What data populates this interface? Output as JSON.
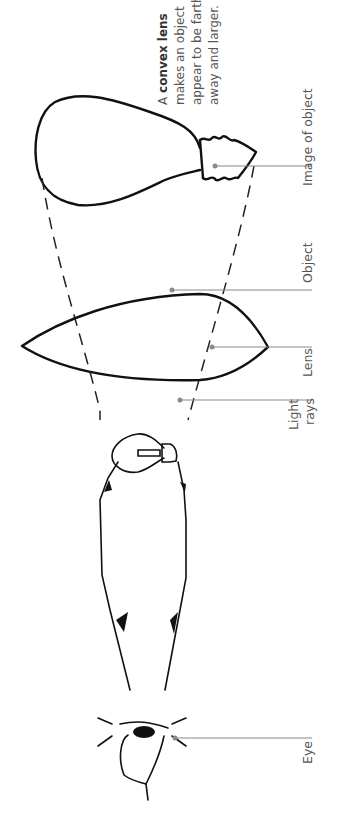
{
  "diagram": {
    "caption": {
      "line1_prefix": "A ",
      "line1_bold": "convex lens",
      "line2": "makes an object",
      "line3": "appear to be farther",
      "line4": "away and larger."
    },
    "labels": {
      "image_of_object": "Image of object",
      "object": "Object",
      "lens": "Lens",
      "light_rays_line1": "Light",
      "light_rays_line2": "rays",
      "eye": "Eye"
    },
    "colors": {
      "ink": "#111111",
      "leader": "#8a8a8a",
      "label_text": "#555555",
      "background": "#ffffff"
    },
    "orientation": "rotated 90 degrees counter-clockwise (text reads bottom-to-top)"
  }
}
